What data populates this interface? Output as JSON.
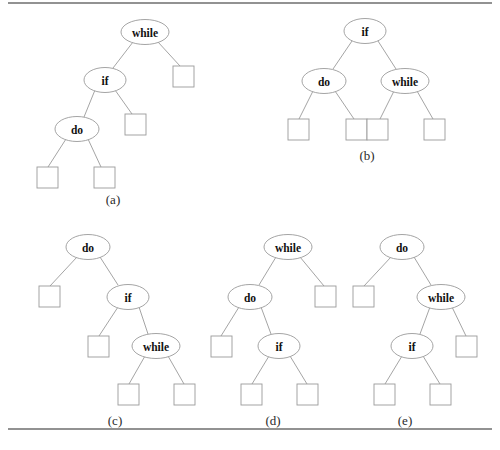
{
  "figure": {
    "background": "#ffffff",
    "edge_color": "#9a9a9a",
    "node_stroke": "#9a9a9a",
    "node_fill": "#ffffff",
    "text_color": "#111111",
    "rule_color": "#6e6e6e",
    "width": 500,
    "height": 450
  },
  "rules": [
    {
      "name": "top-rule",
      "x1": 8,
      "y1": 3,
      "x2": 492,
      "y2": 3
    },
    {
      "name": "bottom-rule",
      "x1": 8,
      "y1": 429,
      "x2": 492,
      "y2": 429
    }
  ],
  "trees": [
    {
      "id": "a",
      "caption": "(a)",
      "caption_x": 113,
      "caption_y": 199,
      "nodes": [
        {
          "id": "a-while",
          "label": "while",
          "cx": 145,
          "cy": 32,
          "rx": 24,
          "ry": 12.5
        },
        {
          "id": "a-if",
          "label": "if",
          "cx": 105,
          "cy": 80,
          "rx": 21,
          "ry": 12.5
        },
        {
          "id": "a-do",
          "label": "do",
          "cx": 77,
          "cy": 129,
          "rx": 22,
          "ry": 12.5
        }
      ],
      "leaves": [
        {
          "id": "a-leaf-1",
          "x": 173,
          "y": 66,
          "w": 21,
          "h": 21
        },
        {
          "id": "a-leaf-2",
          "x": 125,
          "y": 114,
          "w": 21,
          "h": 21
        },
        {
          "id": "a-leaf-3",
          "x": 37,
          "y": 167,
          "w": 21,
          "h": 21
        },
        {
          "id": "a-leaf-4",
          "x": 94,
          "y": 167,
          "w": 21,
          "h": 21
        }
      ],
      "edges": [
        {
          "from": "a-while",
          "to": "a-if",
          "x1": 133,
          "y1": 42,
          "x2": 113,
          "y2": 68
        },
        {
          "from": "a-while",
          "to": "a-leaf-1",
          "x1": 158,
          "y1": 42,
          "x2": 180,
          "y2": 66
        },
        {
          "from": "a-if",
          "to": "a-do",
          "x1": 95,
          "y1": 90,
          "x2": 84,
          "y2": 117
        },
        {
          "from": "a-if",
          "to": "a-leaf-2",
          "x1": 115,
          "y1": 90,
          "x2": 132,
          "y2": 114
        },
        {
          "from": "a-do",
          "to": "a-leaf-3",
          "x1": 66,
          "y1": 139,
          "x2": 48,
          "y2": 167
        },
        {
          "from": "a-do",
          "to": "a-leaf-4",
          "x1": 88,
          "y1": 139,
          "x2": 101,
          "y2": 167
        }
      ]
    },
    {
      "id": "b",
      "caption": "(b)",
      "caption_x": 367,
      "caption_y": 155,
      "nodes": [
        {
          "id": "b-if",
          "label": "if",
          "cx": 365,
          "cy": 31,
          "rx": 21,
          "ry": 12.5
        },
        {
          "id": "b-do",
          "label": "do",
          "cx": 324,
          "cy": 81,
          "rx": 22,
          "ry": 12.5
        },
        {
          "id": "b-while",
          "label": "while",
          "cx": 405,
          "cy": 81,
          "rx": 24,
          "ry": 12.5
        }
      ],
      "leaves": [
        {
          "id": "b-leaf-1",
          "x": 288,
          "y": 119,
          "w": 21,
          "h": 21
        },
        {
          "id": "b-leaf-2",
          "x": 346,
          "y": 119,
          "w": 21,
          "h": 21
        },
        {
          "id": "b-leaf-3",
          "x": 367,
          "y": 119,
          "w": 21,
          "h": 21
        },
        {
          "id": "b-leaf-4",
          "x": 424,
          "y": 119,
          "w": 21,
          "h": 21
        }
      ],
      "edges": [
        {
          "from": "b-if",
          "to": "b-do",
          "x1": 352,
          "y1": 41,
          "x2": 333,
          "y2": 69
        },
        {
          "from": "b-if",
          "to": "b-while",
          "x1": 378,
          "y1": 41,
          "x2": 396,
          "y2": 69
        },
        {
          "from": "b-do",
          "to": "b-leaf-1",
          "x1": 313,
          "y1": 91,
          "x2": 299,
          "y2": 119
        },
        {
          "from": "b-do",
          "to": "b-leaf-2",
          "x1": 335,
          "y1": 91,
          "x2": 354,
          "y2": 119
        },
        {
          "from": "b-while",
          "to": "b-leaf-3",
          "x1": 394,
          "y1": 91,
          "x2": 380,
          "y2": 119
        },
        {
          "from": "b-while",
          "to": "b-leaf-4",
          "x1": 417,
          "y1": 91,
          "x2": 433,
          "y2": 119
        }
      ]
    },
    {
      "id": "c",
      "caption": "(c)",
      "caption_x": 115,
      "caption_y": 420,
      "nodes": [
        {
          "id": "c-do",
          "label": "do",
          "cx": 88,
          "cy": 247,
          "rx": 22,
          "ry": 12.5
        },
        {
          "id": "c-if",
          "label": "if",
          "cx": 128,
          "cy": 297,
          "rx": 21,
          "ry": 12.5
        },
        {
          "id": "c-while",
          "label": "while",
          "cx": 156,
          "cy": 346,
          "rx": 24,
          "ry": 12.5
        }
      ],
      "leaves": [
        {
          "id": "c-leaf-1",
          "x": 39,
          "y": 286,
          "w": 21,
          "h": 21
        },
        {
          "id": "c-leaf-2",
          "x": 88,
          "y": 336,
          "w": 21,
          "h": 21
        },
        {
          "id": "c-leaf-3",
          "x": 118,
          "y": 384,
          "w": 21,
          "h": 21
        },
        {
          "id": "c-leaf-4",
          "x": 174,
          "y": 384,
          "w": 21,
          "h": 21
        }
      ],
      "edges": [
        {
          "from": "c-do",
          "to": "c-leaf-1",
          "x1": 77,
          "y1": 257,
          "x2": 50,
          "y2": 286
        },
        {
          "from": "c-do",
          "to": "c-if",
          "x1": 100,
          "y1": 257,
          "x2": 118,
          "y2": 285
        },
        {
          "from": "c-if",
          "to": "c-leaf-2",
          "x1": 118,
          "y1": 307,
          "x2": 99,
          "y2": 336
        },
        {
          "from": "c-if",
          "to": "c-while",
          "x1": 139,
          "y1": 307,
          "x2": 148,
          "y2": 334
        },
        {
          "from": "c-while",
          "to": "c-leaf-3",
          "x1": 145,
          "y1": 356,
          "x2": 129,
          "y2": 384
        },
        {
          "from": "c-while",
          "to": "c-leaf-4",
          "x1": 168,
          "y1": 356,
          "x2": 184,
          "y2": 384
        }
      ]
    },
    {
      "id": "d",
      "caption": "(d)",
      "caption_x": 273,
      "caption_y": 420,
      "nodes": [
        {
          "id": "d-while",
          "label": "while",
          "cx": 288,
          "cy": 247,
          "rx": 24,
          "ry": 12.5
        },
        {
          "id": "d-do",
          "label": "do",
          "cx": 250,
          "cy": 297,
          "rx": 22,
          "ry": 12.5
        },
        {
          "id": "d-if",
          "label": "if",
          "cx": 279,
          "cy": 346,
          "rx": 21,
          "ry": 12.5
        }
      ],
      "leaves": [
        {
          "id": "d-leaf-1",
          "x": 315,
          "y": 286,
          "w": 21,
          "h": 21
        },
        {
          "id": "d-leaf-2",
          "x": 211,
          "y": 336,
          "w": 21,
          "h": 21
        },
        {
          "id": "d-leaf-3",
          "x": 241,
          "y": 384,
          "w": 21,
          "h": 21
        },
        {
          "id": "d-leaf-4",
          "x": 297,
          "y": 384,
          "w": 21,
          "h": 21
        }
      ],
      "edges": [
        {
          "from": "d-while",
          "to": "d-do",
          "x1": 276,
          "y1": 257,
          "x2": 259,
          "y2": 285
        },
        {
          "from": "d-while",
          "to": "d-leaf-1",
          "x1": 300,
          "y1": 257,
          "x2": 324,
          "y2": 286
        },
        {
          "from": "d-do",
          "to": "d-leaf-2",
          "x1": 239,
          "y1": 307,
          "x2": 221,
          "y2": 336
        },
        {
          "from": "d-do",
          "to": "d-if",
          "x1": 261,
          "y1": 307,
          "x2": 271,
          "y2": 334
        },
        {
          "from": "d-if",
          "to": "d-leaf-3",
          "x1": 269,
          "y1": 356,
          "x2": 252,
          "y2": 384
        },
        {
          "from": "d-if",
          "to": "d-leaf-4",
          "x1": 290,
          "y1": 356,
          "x2": 307,
          "y2": 384
        }
      ]
    },
    {
      "id": "e",
      "caption": "(e)",
      "caption_x": 405,
      "caption_y": 420,
      "nodes": [
        {
          "id": "e-do",
          "label": "do",
          "cx": 402,
          "cy": 247,
          "rx": 22,
          "ry": 12.5
        },
        {
          "id": "e-while",
          "label": "while",
          "cx": 441,
          "cy": 297,
          "rx": 24,
          "ry": 12.5
        },
        {
          "id": "e-if",
          "label": "if",
          "cx": 412,
          "cy": 346,
          "rx": 21,
          "ry": 12.5
        }
      ],
      "leaves": [
        {
          "id": "e-leaf-1",
          "x": 353,
          "y": 286,
          "w": 21,
          "h": 21
        },
        {
          "id": "e-leaf-2",
          "x": 456,
          "y": 336,
          "w": 21,
          "h": 21
        },
        {
          "id": "e-leaf-3",
          "x": 374,
          "y": 384,
          "w": 21,
          "h": 21
        },
        {
          "id": "e-leaf-4",
          "x": 430,
          "y": 384,
          "w": 21,
          "h": 21
        }
      ],
      "edges": [
        {
          "from": "e-do",
          "to": "e-leaf-1",
          "x1": 391,
          "y1": 257,
          "x2": 364,
          "y2": 286
        },
        {
          "from": "e-do",
          "to": "e-while",
          "x1": 414,
          "y1": 257,
          "x2": 431,
          "y2": 285
        },
        {
          "from": "e-while",
          "to": "e-if",
          "x1": 430,
          "y1": 307,
          "x2": 420,
          "y2": 334
        },
        {
          "from": "e-while",
          "to": "e-leaf-2",
          "x1": 452,
          "y1": 307,
          "x2": 466,
          "y2": 336
        },
        {
          "from": "e-if",
          "to": "e-leaf-3",
          "x1": 402,
          "y1": 356,
          "x2": 385,
          "y2": 384
        },
        {
          "from": "e-if",
          "to": "e-leaf-4",
          "x1": 423,
          "y1": 356,
          "x2": 440,
          "y2": 384
        }
      ]
    }
  ]
}
